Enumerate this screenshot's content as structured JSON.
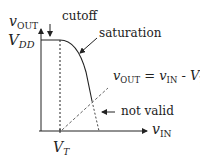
{
  "diagram": {
    "y_axis": {
      "var": "v",
      "sub": "OUT"
    },
    "x_axis": {
      "var": "v",
      "sub": "IN"
    },
    "vdd": {
      "var": "V",
      "sub": "DD"
    },
    "vt": {
      "var": "V",
      "sub": "T"
    },
    "annotations": {
      "cutoff": "cutoff",
      "saturation": "saturation",
      "not_valid": "not valid",
      "eq_lhs_var": "v",
      "eq_lhs_sub": "OUT",
      "eq_mid": " = ",
      "eq_rhs_var": "v",
      "eq_rhs_sub": "IN",
      "eq_minus": " - ",
      "eq_vt_var": "V",
      "eq_vt_sub": "T"
    },
    "colors": {
      "line": "#222222",
      "dash": "#555555"
    }
  }
}
